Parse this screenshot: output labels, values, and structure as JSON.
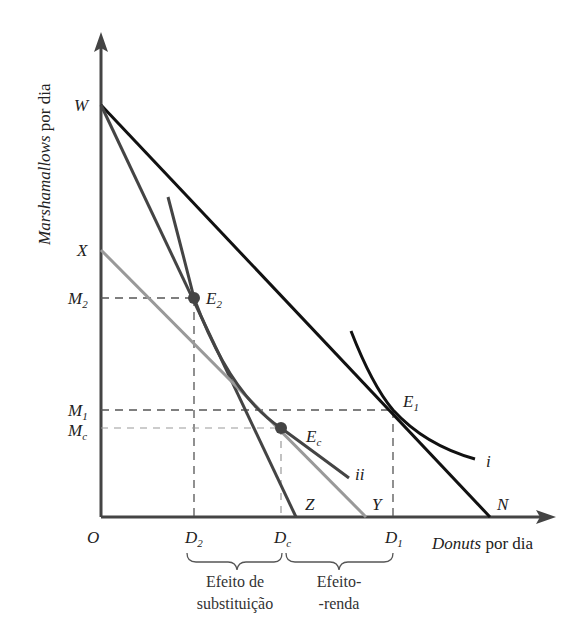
{
  "axes": {
    "y_label_italic": "Marshamallows",
    "y_label_rest": " por dia",
    "x_label_italic": "Donuts",
    "x_label_rest": " por dia",
    "origin": "O"
  },
  "y_ticks": {
    "W": "W",
    "X": "X",
    "M2_main": "M",
    "M2_sub": "2",
    "M1_main": "M",
    "M1_sub": "1",
    "Mc_main": "M",
    "Mc_sub": "c"
  },
  "x_ticks": {
    "D2_main": "D",
    "D2_sub": "2",
    "Dc_main": "D",
    "Dc_sub": "c",
    "D1_main": "D",
    "D1_sub": "1",
    "Z": "Z",
    "Y": "Y",
    "N": "N"
  },
  "points": {
    "E2_main": "E",
    "E2_sub": "2",
    "Ec_main": "E",
    "Ec_sub": "c",
    "E1_main": "E",
    "E1_sub": "1"
  },
  "curves": {
    "i": "i",
    "ii": "ii"
  },
  "braces": {
    "substitution_line1": "Efeito de",
    "substitution_line2": "substituição",
    "income_line1": "Efeito-",
    "income_line2": "-renda"
  },
  "colors": {
    "original_budget": "#111111",
    "new_budget": "#444444",
    "compensated_budget": "#999999",
    "indifference_i": "#111111",
    "indifference_ii": "#444444",
    "dashed": "#555555"
  }
}
